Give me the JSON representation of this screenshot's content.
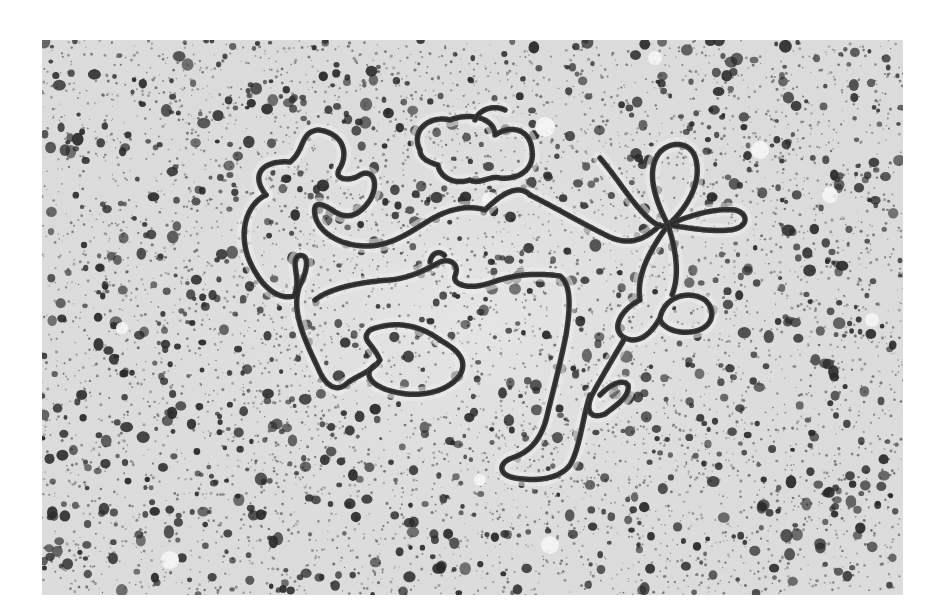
{
  "figure": {
    "kind": "electron-micrograph",
    "colors": {
      "page_background": "#ffffff",
      "field_background": "#dcdcdc",
      "field_light": "#ececec",
      "stipple_dark": "#2a2a2a",
      "stipple_mid": "#555555",
      "strand": "#3a3a3a"
    },
    "frame": {
      "x": 42,
      "y": 40,
      "width": 861,
      "height": 555
    },
    "strand_paths": [
      "M 266 195 C 250 175, 262 160, 290 162 C 305 150, 300 132, 318 130 C 340 132, 350 150, 340 168 C 332 180, 350 182, 360 175 C 372 168, 380 182, 370 200 C 360 215, 348 220, 335 212 C 325 205, 312 198, 315 215 C 318 232, 340 246, 366 246 C 392 246, 410 232, 430 220 C 450 208, 470 205, 485 210 C 505 190, 520 185, 530 195",
      "M 266 195 C 245 205, 238 235, 250 262 C 262 288, 278 300, 294 296 C 302 280, 290 262, 298 256 C 310 252, 308 270, 300 285 C 290 310, 305 340, 318 368 C 325 385, 335 392, 345 385 C 355 376, 372 372, 380 360 C 372 342, 360 340, 370 330 C 395 320, 420 325, 440 340",
      "M 315 300 C 330 288, 360 282, 390 280 C 410 278, 425 270, 440 262 C 450 258, 460 264, 455 276 C 452 285, 470 290, 490 283 C 510 276, 530 272, 560 276 C 572 285, 570 310, 566 335 C 560 365, 552 395, 546 420 C 540 440, 530 452, 512 458 C 498 463, 498 475, 515 478 C 540 482, 560 478, 570 465 C 580 448, 582 420, 590 395",
      "M 440 340 C 458 350, 468 360, 460 375 C 448 392, 420 398, 395 392 C 375 388, 360 375, 375 365",
      "M 420 150 C 410 130, 430 115, 450 120 C 470 112, 495 118, 495 135 C 510 125, 530 128, 532 150 C 535 168, 520 180, 500 178 C 490 175, 480 185, 470 180 C 455 185, 440 178, 438 165 C 428 162, 420 158, 420 150",
      "M 530 195 C 560 210, 590 228, 612 238 C 630 245, 645 240, 660 225",
      "M 600 158 C 615 175, 630 200, 645 215 C 655 225, 662 228, 668 225",
      "M 668 225 C 655 200, 645 170, 660 152 C 672 140, 692 142, 696 160 C 702 185, 685 210, 668 225",
      "M 668 225 C 690 215, 715 208, 735 210 C 750 214, 748 228, 730 230 C 710 232, 690 228, 668 225",
      "M 668 225 C 650 250, 636 275, 640 300 C 620 310, 610 330, 625 338 C 640 345, 652 332, 660 318 C 665 295, 690 290, 705 300 C 718 312, 712 330, 690 332 C 675 334, 660 326, 660 318",
      "M 668 225 C 676 250, 680 275, 672 295",
      "M 625 338 C 612 360, 600 380, 592 395 C 585 410, 590 420, 605 414 C 618 404, 630 396, 628 385 C 622 378, 610 385, 600 395",
      "M 475 120 C 480 108, 495 105, 505 110",
      "M 430 262 C 432 252, 440 250, 445 256"
    ],
    "bright_spots": [
      {
        "x": 545,
        "y": 127,
        "r": 10
      },
      {
        "x": 490,
        "y": 200,
        "r": 8
      },
      {
        "x": 760,
        "y": 150,
        "r": 9
      },
      {
        "x": 830,
        "y": 195,
        "r": 8
      },
      {
        "x": 872,
        "y": 320,
        "r": 7
      },
      {
        "x": 550,
        "y": 545,
        "r": 9
      },
      {
        "x": 170,
        "y": 560,
        "r": 9
      },
      {
        "x": 655,
        "y": 58,
        "r": 7
      },
      {
        "x": 122,
        "y": 328,
        "r": 6
      },
      {
        "x": 480,
        "y": 480,
        "r": 6
      }
    ],
    "stipple": {
      "seed": 1337,
      "large_count": 1150,
      "small_count": 5200,
      "large_radius": [
        2.2,
        6.0
      ],
      "small_radius": [
        0.5,
        1.6
      ]
    }
  }
}
